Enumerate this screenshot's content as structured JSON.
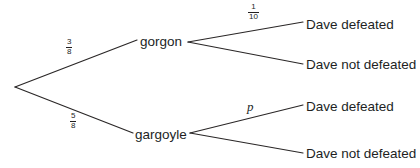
{
  "diagram": {
    "type": "probability-tree",
    "root": {
      "x": 15,
      "y": 87
    },
    "stroke_color": "#2a2727",
    "text_color": "#221f1f",
    "background": "#ffffff",
    "nodes": {
      "gorgon": {
        "label": "gorgon",
        "x": 140,
        "y": 42
      },
      "gargoyle": {
        "label": "gargoyle",
        "x": 135,
        "y": 135
      }
    },
    "leaves": [
      {
        "label": "Dave defeated",
        "x": 306,
        "y": 25,
        "parent": "gorgon"
      },
      {
        "label": "Dave not defeated",
        "x": 306,
        "y": 65,
        "parent": "gorgon"
      },
      {
        "label": "Dave defeated",
        "x": 306,
        "y": 107,
        "parent": "gargoyle"
      },
      {
        "label": "Dave not defeated",
        "x": 306,
        "y": 154,
        "parent": "gargoyle"
      }
    ],
    "branch_labels": [
      {
        "kind": "fraction",
        "numerator": "3",
        "denominator": "8",
        "x": 66,
        "y": 38,
        "branch": "root-to-gorgon"
      },
      {
        "kind": "fraction",
        "numerator": "5",
        "denominator": "8",
        "x": 70,
        "y": 112,
        "branch": "root-to-gargoyle"
      },
      {
        "kind": "fraction",
        "numerator": "1",
        "denominator": "10",
        "x": 248,
        "y": 3,
        "branch": "gorgon-to-defeated"
      },
      {
        "kind": "variable",
        "text": "p",
        "x": 247,
        "y": 100,
        "branch": "gargoyle-to-defeated"
      }
    ]
  }
}
